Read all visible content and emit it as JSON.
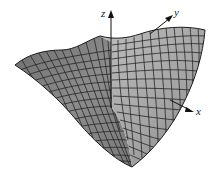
{
  "figure": {
    "surface_fill": "#8a8a8a",
    "surface_fill_light": "#b5b5b5",
    "grid_color": "#2a2a2a",
    "axis_color": "#111111"
  },
  "axes": {
    "z": {
      "label": "z"
    },
    "y": {
      "label": "y"
    },
    "x": {
      "label": "x"
    }
  }
}
